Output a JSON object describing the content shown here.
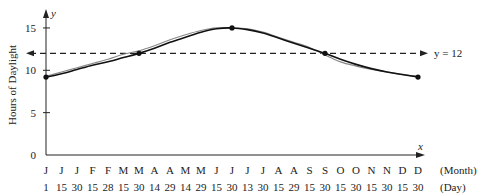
{
  "chart_data": {
    "type": "line",
    "title": "",
    "xlabel": "",
    "ylabel": "Hours of Daylight",
    "x_axis_symbol": "x",
    "y_axis_symbol": "y",
    "ylim": [
      0,
      16
    ],
    "yticks": [
      0,
      5,
      10,
      15
    ],
    "grid": false,
    "x_row_labels": [
      "(Month)",
      "(Day)"
    ],
    "categories_month": [
      "J",
      "J",
      "J",
      "F",
      "F",
      "M",
      "M",
      "A",
      "A",
      "M",
      "M",
      "J",
      "J",
      "J",
      "J",
      "A",
      "A",
      "S",
      "S",
      "O",
      "O",
      "N",
      "N",
      "D",
      "D"
    ],
    "categories_day": [
      "1",
      "15",
      "30",
      "15",
      "28",
      "15",
      "30",
      "14",
      "29",
      "14",
      "29",
      "15",
      "30",
      "13",
      "30",
      "15",
      "29",
      "15",
      "30",
      "15",
      "30",
      "15",
      "30",
      "15",
      "30"
    ],
    "reference_line": {
      "y": 12,
      "label": "y = 12",
      "style": "dashed"
    },
    "marked_points": [
      {
        "date": "J 1",
        "y": 9.2
      },
      {
        "date": "M 30",
        "y": 12
      },
      {
        "date": "J 30",
        "y": 15
      },
      {
        "date": "S 30",
        "y": 12
      },
      {
        "date": "D 30",
        "y": 9.2
      }
    ],
    "series": [
      {
        "name": "model curve",
        "color": "#111111",
        "values": [
          9.2,
          9.6,
          10.1,
          10.6,
          11.0,
          11.5,
          12.0,
          12.6,
          13.3,
          13.9,
          14.5,
          14.9,
          15.0,
          14.8,
          14.4,
          13.8,
          13.2,
          12.6,
          12.0,
          11.3,
          10.7,
          10.2,
          9.8,
          9.5,
          9.2
        ]
      },
      {
        "name": "actual data",
        "color": "#888888",
        "values": [
          9.3,
          9.8,
          10.3,
          10.8,
          11.3,
          11.9,
          12.3,
          12.9,
          13.6,
          14.2,
          14.7,
          15.0,
          15.0,
          14.9,
          14.5,
          13.9,
          13.3,
          12.7,
          11.8,
          11.0,
          10.5,
          10.1,
          9.8,
          9.5,
          9.3
        ]
      }
    ]
  }
}
